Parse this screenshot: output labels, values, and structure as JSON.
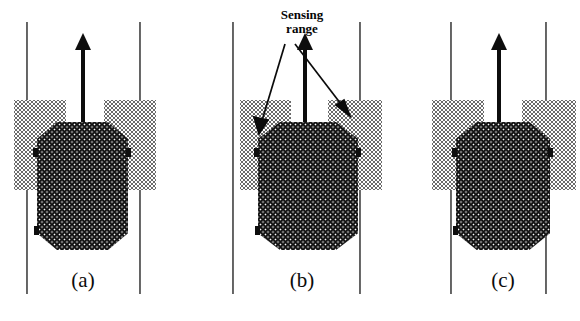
{
  "figure": {
    "type": "diagram",
    "background_color": "#ffffff",
    "vehicle_color": "#111111",
    "lane_line_color": "#2c2c2c",
    "sensing_band_color": "#6b6b6b",
    "annotation": {
      "label_line_1": "Sensing",
      "label_line_2": "range",
      "leader_count": 2,
      "leader_targets": [
        "left sensing band",
        "right sensing band"
      ]
    },
    "panels": [
      {
        "id": "panel-a",
        "caption": "(a)",
        "vehicle_position": "centered",
        "lane_lines_x": [
          26,
          140
        ],
        "vehicle_x_range": [
          37,
          128
        ],
        "sensing_bands_x": [
          [
            14,
            65
          ],
          [
            104,
            156
          ]
        ]
      },
      {
        "id": "panel-b",
        "caption": "(b)",
        "vehicle_position": "shifted right",
        "lane_lines_x": [
          232,
          360
        ],
        "vehicle_x_range": [
          258,
          358
        ],
        "sensing_bands_x": [
          [
            240,
            290
          ],
          [
            328,
            382
          ]
        ]
      },
      {
        "id": "panel-c",
        "caption": "(c)",
        "vehicle_position": "overlapping right lane line",
        "lane_lines_x": [
          450,
          546
        ],
        "vehicle_x_range": [
          456,
          550
        ],
        "sensing_bands_x": [
          [
            432,
            484
          ],
          [
            522,
            576
          ]
        ]
      }
    ]
  }
}
